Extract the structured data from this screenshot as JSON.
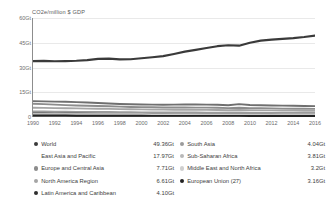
{
  "chart_data": {
    "type": "line",
    "title": "",
    "ylabel": "CO2e/million $ GDP",
    "xlabel": "",
    "ylim": [
      0,
      60
    ],
    "yticks": [
      "0",
      "15Gt",
      "30Gt",
      "45Gt",
      "60Gt"
    ],
    "ytick_values": [
      0,
      15,
      30,
      45,
      60
    ],
    "grid": true,
    "legend_position": "below",
    "x": [
      1990,
      1991,
      1992,
      1993,
      1994,
      1995,
      1996,
      1997,
      1998,
      1999,
      2000,
      2001,
      2002,
      2003,
      2004,
      2005,
      2006,
      2007,
      2008,
      2009,
      2010,
      2011,
      2012,
      2013,
      2014,
      2015,
      2016
    ],
    "xticks": [
      "1990",
      "1992",
      "1994",
      "1996",
      "1998",
      "2000",
      "2002",
      "2004",
      "2006",
      "2008",
      "2010",
      "2012",
      "2014",
      "2016"
    ],
    "xtick_values": [
      1990,
      1992,
      1994,
      1996,
      1998,
      2000,
      2002,
      2004,
      2006,
      2008,
      2010,
      2012,
      2014,
      2016
    ],
    "series": [
      {
        "name": "World",
        "value_label": "49.36Gt",
        "color": "#3a3a3a",
        "values": [
          33.9,
          34.0,
          33.8,
          33.9,
          34.1,
          34.5,
          35.2,
          35.4,
          34.9,
          35.0,
          35.6,
          36.2,
          36.9,
          38.2,
          39.6,
          40.7,
          41.8,
          42.9,
          43.5,
          43.2,
          45.0,
          46.3,
          46.9,
          47.4,
          47.8,
          48.5,
          49.36
        ]
      },
      {
        "name": "East Asia and Pacific",
        "value_label": "17.97Gt",
        "color": "#6f6f6f",
        "values": [
          9.6,
          9.5,
          9.3,
          9.2,
          9.0,
          8.8,
          8.5,
          8.2,
          7.9,
          7.7,
          7.6,
          7.5,
          7.4,
          7.5,
          7.6,
          7.6,
          7.5,
          7.4,
          7.1,
          7.8,
          7.3,
          7.1,
          7.0,
          6.9,
          6.8,
          6.7,
          6.6
        ]
      },
      {
        "name": "Europe and Central Asia",
        "value_label": "7.71Gt",
        "color": "#8c8c8c",
        "values": [
          8.0,
          7.8,
          7.5,
          7.2,
          7.0,
          6.8,
          6.7,
          6.5,
          6.3,
          6.1,
          6.0,
          5.9,
          5.8,
          5.8,
          5.8,
          5.7,
          5.7,
          5.6,
          5.4,
          5.6,
          5.4,
          5.3,
          5.2,
          5.1,
          5.0,
          5.0,
          4.9
        ]
      },
      {
        "name": "North America Region",
        "value_label": "6.61Gt",
        "color": "#a5a5a5",
        "values": [
          5.6,
          5.5,
          5.4,
          5.3,
          5.2,
          5.1,
          5.0,
          4.9,
          4.8,
          4.7,
          4.6,
          4.5,
          4.5,
          4.4,
          4.4,
          4.3,
          4.3,
          4.2,
          4.1,
          4.2,
          4.1,
          4.0,
          4.0,
          3.9,
          3.9,
          3.8,
          3.8
        ]
      },
      {
        "name": "Latin America and Caribbean",
        "value_label": "4.10Gt",
        "color": "#2e2e2e",
        "values": [
          2.5,
          2.5,
          2.4,
          2.4,
          2.4,
          2.3,
          2.3,
          2.3,
          2.2,
          2.2,
          2.2,
          2.2,
          2.1,
          2.1,
          2.1,
          2.1,
          2.0,
          2.0,
          2.0,
          2.0,
          1.9,
          1.9,
          1.9,
          1.9,
          1.8,
          1.8,
          1.8
        ]
      },
      {
        "name": "South Asia",
        "value_label": "4.04Gt",
        "color": "#9b9b9b",
        "values": [
          3.3,
          3.3,
          3.2,
          3.2,
          3.1,
          3.1,
          3.0,
          3.0,
          2.9,
          2.9,
          2.8,
          2.8,
          2.8,
          2.7,
          2.7,
          2.7,
          2.6,
          2.6,
          2.6,
          2.6,
          2.5,
          2.5,
          2.5,
          2.4,
          2.4,
          2.4,
          2.4
        ]
      },
      {
        "name": "Sub-Saharan Africa",
        "value_label": "3.81Gt",
        "color": "#b8b8b8",
        "values": [
          2.0,
          2.0,
          2.0,
          1.9,
          1.9,
          1.9,
          1.9,
          1.8,
          1.8,
          1.8,
          1.8,
          1.7,
          1.7,
          1.7,
          1.7,
          1.7,
          1.6,
          1.6,
          1.6,
          1.6,
          1.6,
          1.5,
          1.5,
          1.5,
          1.5,
          1.5,
          1.5
        ]
      },
      {
        "name": "Middle East and North Africa",
        "value_label": "3.2Gt",
        "color": "#cfcfcf",
        "values": [
          1.4,
          1.4,
          1.4,
          1.4,
          1.3,
          1.3,
          1.3,
          1.3,
          1.3,
          1.2,
          1.2,
          1.2,
          1.2,
          1.2,
          1.2,
          1.1,
          1.1,
          1.1,
          1.1,
          1.1,
          1.1,
          1.1,
          1.0,
          1.0,
          1.0,
          1.0,
          1.0
        ]
      },
      {
        "name": "European Union (27)",
        "value_label": "3.16Gt",
        "color": "#222222",
        "values": [
          0.9,
          0.9,
          0.9,
          0.9,
          0.8,
          0.8,
          0.8,
          0.8,
          0.8,
          0.8,
          0.8,
          0.7,
          0.7,
          0.7,
          0.7,
          0.7,
          0.7,
          0.7,
          0.7,
          0.7,
          0.6,
          0.6,
          0.6,
          0.6,
          0.6,
          0.6,
          0.6
        ]
      }
    ]
  },
  "legend": {
    "left_column": [
      {
        "label": "World",
        "value": "49.36Gt",
        "color": "#3a3a3a",
        "marker": true
      },
      {
        "label": "East Asia and Pacific",
        "value": "17.97Gt",
        "color": "#6f6f6f",
        "marker": false
      },
      {
        "label": "Europe and Central Asia",
        "value": "7.71Gt",
        "color": "#8c8c8c",
        "marker": true
      },
      {
        "label": "North America Region",
        "value": "6.61Gt",
        "color": "#a5a5a5",
        "marker": true
      },
      {
        "label": "Latin America and Caribbean",
        "value": "4.10Gt",
        "color": "#2e2e2e",
        "marker": true
      }
    ],
    "right_column": [
      {
        "label": "South Asia",
        "value": "4.04Gt",
        "color": "#9b9b9b",
        "marker": true
      },
      {
        "label": "Sub-Saharan Africa",
        "value": "3.81Gt",
        "color": "#b8b8b8",
        "marker": true
      },
      {
        "label": "Middle East and North Africa",
        "value": "3.2Gt",
        "color": "#cfcfcf",
        "marker": true
      },
      {
        "label": "European Union (27)",
        "value": "3.16Gt",
        "color": "#222222",
        "marker": true
      }
    ]
  },
  "colors": {
    "axis": "#8d8d8d",
    "grid": "#e9e9e9",
    "text": "#5a5a5a",
    "background": "#ffffff"
  }
}
